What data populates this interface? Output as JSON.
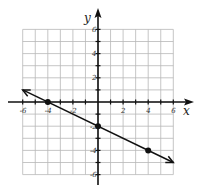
{
  "chart_data": {
    "type": "line",
    "title": "",
    "xlabel": "x",
    "ylabel": "y",
    "xlim": [
      -6,
      6
    ],
    "ylim": [
      -6,
      6
    ],
    "grid": true,
    "x_tick_labels": [
      "-6",
      "-4",
      "-2",
      "2",
      "4",
      "6"
    ],
    "y_tick_labels": [
      "6",
      "4",
      "2",
      "-2",
      "-4",
      "-6"
    ],
    "series": [
      {
        "name": "line",
        "equation": "y = -x/2 - 2",
        "x": [
          -6,
          6
        ],
        "y": [
          1,
          -5
        ],
        "arrows": "both ends"
      }
    ],
    "points": [
      {
        "x": -4,
        "y": 0
      },
      {
        "x": 0,
        "y": -2
      },
      {
        "x": 4,
        "y": -4
      }
    ]
  }
}
